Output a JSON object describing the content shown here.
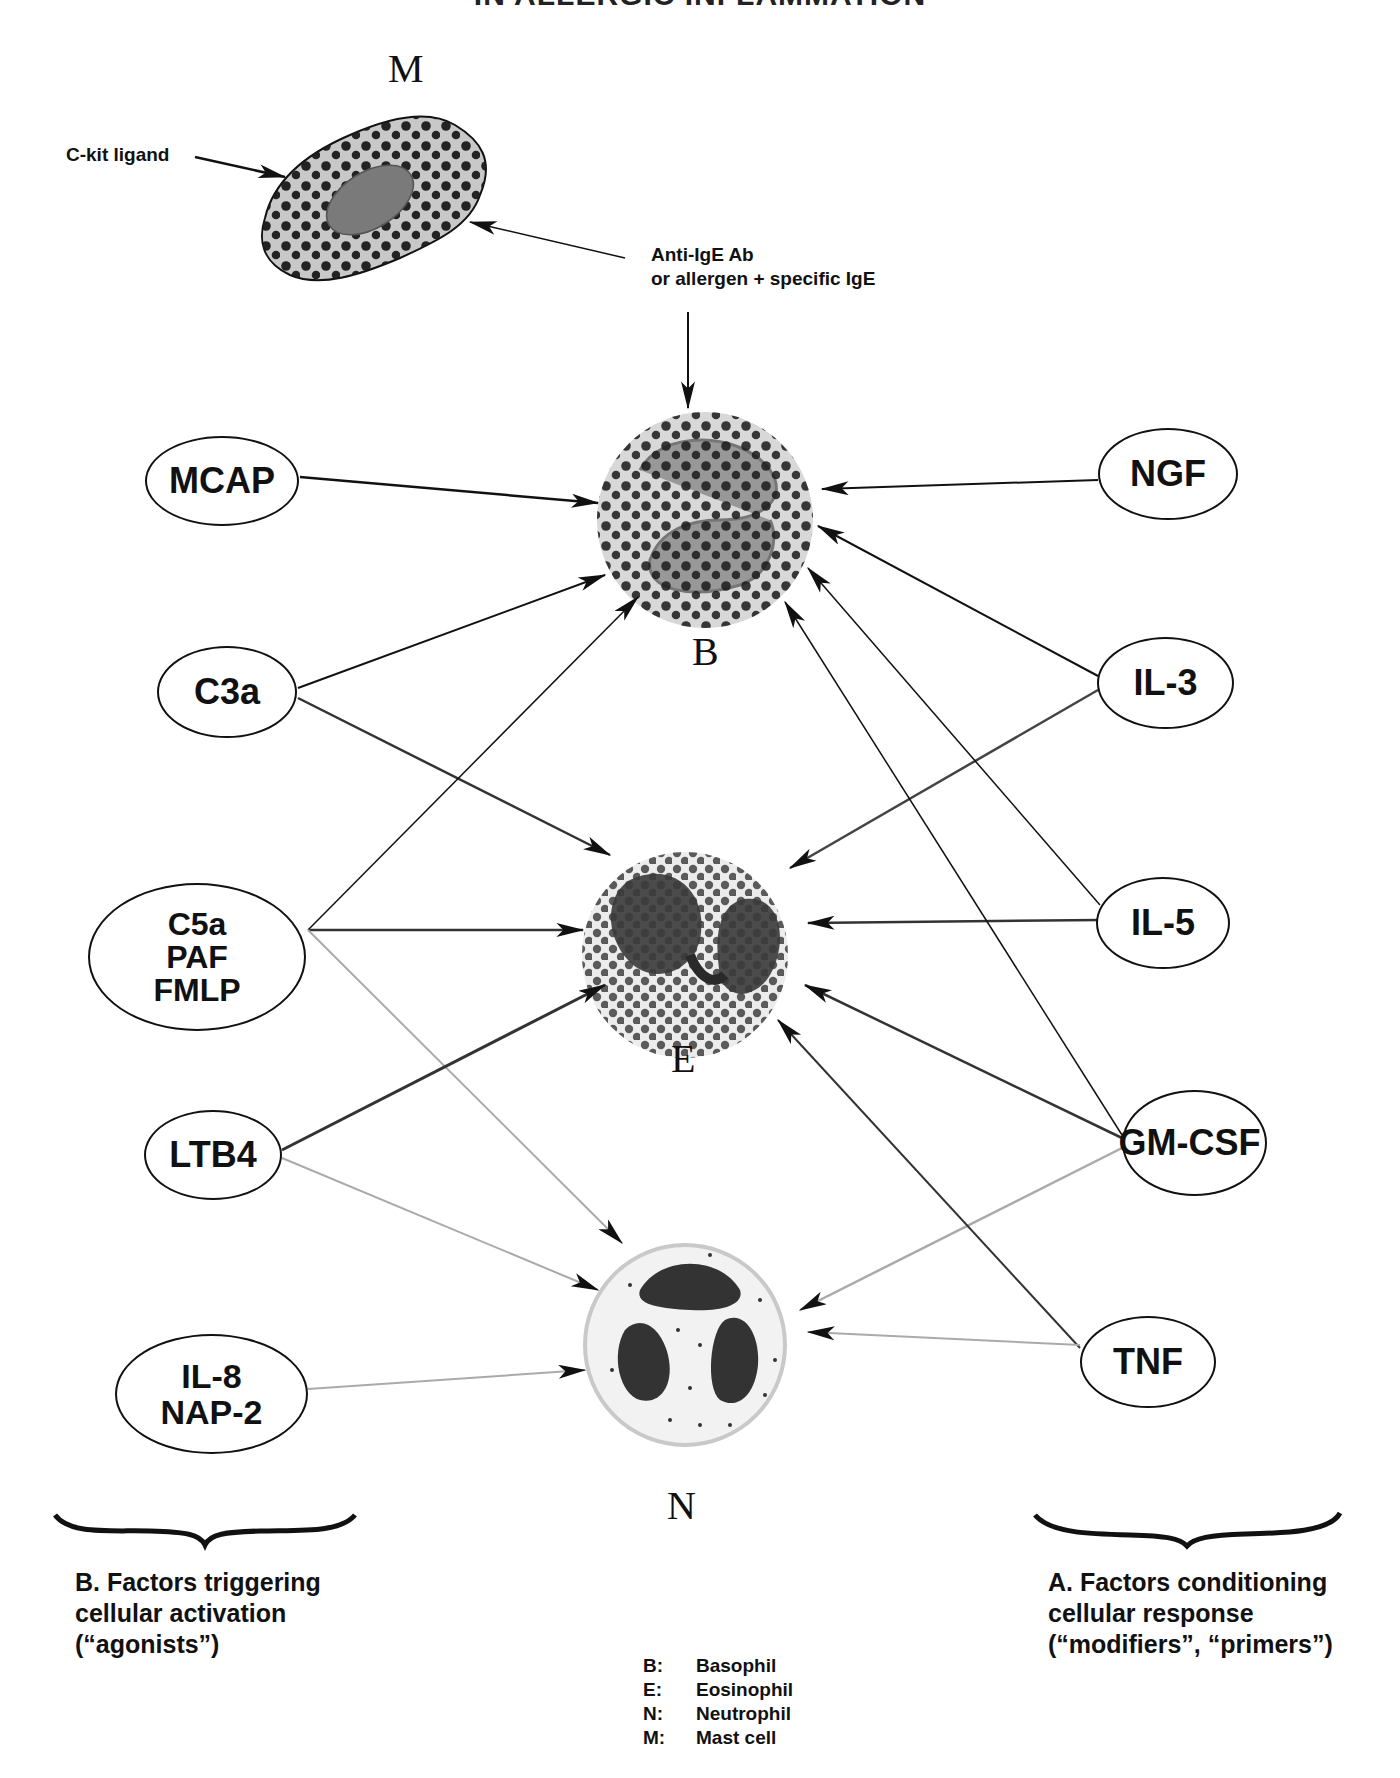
{
  "title": "IN ALLERGIC INFLAMMATION",
  "cells": {
    "mast": {
      "letter": "M"
    },
    "basophil": {
      "letter": "B"
    },
    "eosinophil": {
      "letter": "E"
    },
    "neutrophil": {
      "letter": "N"
    }
  },
  "annotations": {
    "ckit": "C-kit ligand",
    "anti_ige_line1": "Anti-IgE Ab",
    "anti_ige_line2": "or allergen + specific IgE"
  },
  "agonists": {
    "mcap": "MCAP",
    "c3a": "C3a",
    "c5a_paf_fmlp": "C5a\nPAF\nFMLP",
    "ltb4": "LTB4",
    "il8_nap2": "IL-8\nNAP-2"
  },
  "modifiers": {
    "ngf": "NGF",
    "il3": "IL-3",
    "il5": "IL-5",
    "gmcsf": "GM-CSF",
    "tnf": "TNF"
  },
  "captions": {
    "left_line1": "B. Factors triggering",
    "left_line2": "cellular activation",
    "left_line3": "(“agonists”)",
    "right_line1": "A. Factors conditioning",
    "right_line2": "cellular response",
    "right_line3": "(“modifiers”, “primers”)"
  },
  "legend": [
    {
      "key": "B:",
      "value": "Basophil"
    },
    {
      "key": "E:",
      "value": "Eosinophil"
    },
    {
      "key": "N:",
      "value": "Neutrophil"
    },
    {
      "key": "M:",
      "value": "Mast cell"
    }
  ],
  "colors": {
    "ink": "#111111",
    "grey_arrow": "#9a9a9a",
    "cell_fill": "#cfcfcf",
    "granule": "#1a1a1a"
  }
}
